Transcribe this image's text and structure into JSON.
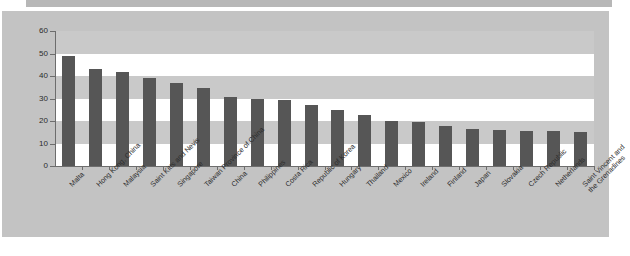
{
  "chart_data": {
    "type": "bar",
    "title": "",
    "subtitle": "",
    "xlabel": "",
    "ylabel": "",
    "ylim": [
      0,
      60
    ],
    "ytick_labels": [
      "0",
      "10",
      "20",
      "30",
      "40",
      "50",
      "60"
    ],
    "yticks": [
      0,
      10,
      20,
      30,
      40,
      50,
      60
    ],
    "grid": "horizontal-bands",
    "legend": "none",
    "bar_color": "#565656",
    "plot_background": "#ffffff",
    "band_color": "#c9c9c9",
    "panel_color": "#c3c3c3",
    "categories": [
      "Malta",
      "Hong Kong, China",
      "Malaysia",
      "Saint Kitts and Nevis",
      "Singapore",
      "Taiwan Province of China",
      "China",
      "Philippines",
      "Costa Rica",
      "Republic of Korea",
      "Hungary",
      "Thailand",
      "Mexico",
      "Ireland",
      "Finland",
      "Japan",
      "Slovakia",
      "Czech Republic",
      "Netherlands",
      "Saint Vincent and the Grenadines"
    ],
    "category_lines": [
      [
        "Malta"
      ],
      [
        "Hong Kong, China"
      ],
      [
        "Malaysia"
      ],
      [
        "Saint Kitts and Nevis"
      ],
      [
        "Singapore"
      ],
      [
        "Taiwan Province of China"
      ],
      [
        "China"
      ],
      [
        "Philippines"
      ],
      [
        "Costa Rica"
      ],
      [
        "Republic of Korea"
      ],
      [
        "Hungary"
      ],
      [
        "Thailand"
      ],
      [
        "Mexico"
      ],
      [
        "Ireland"
      ],
      [
        "Finland"
      ],
      [
        "Japan"
      ],
      [
        "Slovakia"
      ],
      [
        "Czech Republic"
      ],
      [
        "Netherlands"
      ],
      [
        "Saint Vincent and",
        "the Grenadines"
      ]
    ],
    "values": [
      49,
      43,
      42,
      39,
      37,
      34.5,
      30.5,
      30,
      29.5,
      27,
      25,
      22.5,
      20,
      19.5,
      18,
      16.5,
      16,
      15.5,
      15.5,
      15
    ]
  },
  "source_note": ""
}
